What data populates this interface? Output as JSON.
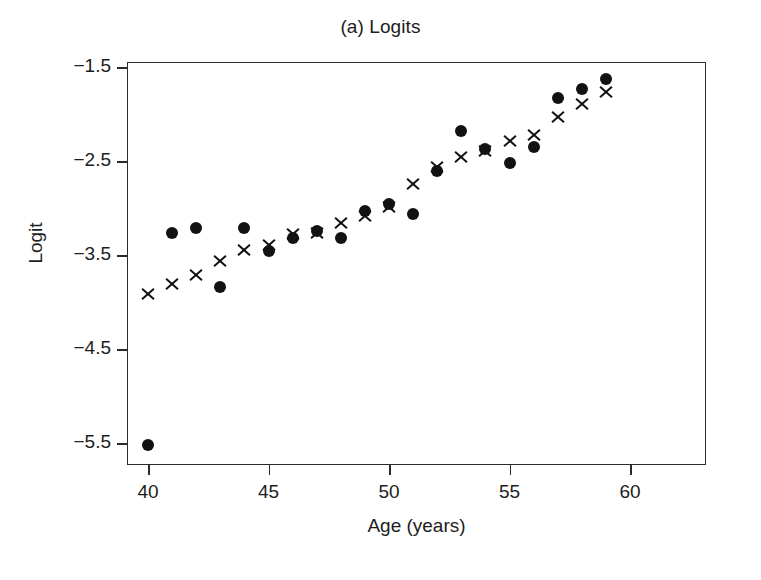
{
  "chart_data": {
    "type": "scatter",
    "title": "(a) Logits",
    "xlabel": "Age (years)",
    "ylabel": "Logit",
    "xlim": [
      39.2,
      60.1
    ],
    "ylim": [
      -5.78,
      -1.26
    ],
    "grid": false,
    "legend": "none",
    "xticks": [
      40,
      45,
      50,
      55,
      60
    ],
    "xtick_labels": [
      "40",
      "45",
      "50",
      "55",
      "60"
    ],
    "yticks": [
      -1.5,
      -2.5,
      -3.5,
      -4.5,
      -5.5
    ],
    "ytick_labels": [
      "−1.5",
      "−2.5",
      "−3.5",
      "−4.5",
      "−5.5"
    ],
    "x": [
      40,
      41,
      42,
      43,
      44,
      45,
      46,
      47,
      48,
      49,
      50,
      51,
      52,
      53,
      54,
      55,
      56,
      57,
      58,
      59
    ],
    "series": [
      {
        "name": "observed",
        "marker": "circle",
        "color": "#121212",
        "values": [
          -5.51,
          -3.26,
          -3.2,
          -3.83,
          -3.2,
          -3.45,
          -3.31,
          -3.23,
          -3.31,
          -3.02,
          -2.95,
          -3.05,
          -2.6,
          -2.17,
          -2.36,
          -2.51,
          -2.34,
          -1.82,
          -1.72,
          -1.62
        ]
      },
      {
        "name": "fitted",
        "marker": "cross",
        "color": "#121212",
        "values": [
          -3.9,
          -3.8,
          -3.7,
          -3.55,
          -3.44,
          -3.38,
          -3.27,
          -3.26,
          -3.15,
          -3.07,
          -2.98,
          -2.73,
          -2.55,
          -2.45,
          -2.38,
          -2.28,
          -2.21,
          -2.02,
          -1.88,
          -1.76
        ]
      }
    ]
  },
  "axes": {
    "x_pixel_min": 148,
    "x_pixel_per_unit": 24.1,
    "y_pixel_ref": 68,
    "y_pixel_per_unit": 94
  }
}
